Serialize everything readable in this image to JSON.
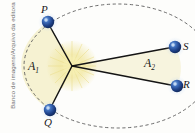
{
  "figure": {
    "credit": "Banco de imagens/Arquivo da editora",
    "background_color": "#fdfdfb",
    "orbit": {
      "style": "dashed-ellipse",
      "stroke_color": "#5a5a5a",
      "center_x": 118,
      "center_y": 66,
      "radius_x": 94,
      "radius_y": 62
    },
    "focus": {
      "name": "sun-focus",
      "x": 72,
      "y": 66,
      "glow_color": "#efe49a",
      "core_color": "#f7f0b8"
    },
    "sectors": [
      {
        "id": "A1",
        "label": "A",
        "subscript": "1",
        "fill_color": "#f6f2d2",
        "vertices": [
          "focus",
          "P",
          "Q"
        ]
      },
      {
        "id": "A2",
        "label": "A",
        "subscript": "2",
        "fill_color": "#f6f4dc",
        "vertices": [
          "focus",
          "S",
          "R"
        ]
      }
    ],
    "points": [
      {
        "id": "P",
        "label": "P",
        "x": 48,
        "y": 22,
        "color": "#1d3f85",
        "highlight_color": "#7fa8e0"
      },
      {
        "id": "Q",
        "label": "Q",
        "x": 50,
        "y": 110,
        "color": "#1d3f85",
        "highlight_color": "#7fa8e0"
      },
      {
        "id": "S",
        "label": "S",
        "x": 175,
        "y": 47,
        "color": "#1d3f85",
        "highlight_color": "#7fa8e0"
      },
      {
        "id": "R",
        "label": "R",
        "x": 177,
        "y": 86,
        "color": "#1d3f85",
        "highlight_color": "#7fa8e0"
      }
    ],
    "radii_lines": [
      {
        "from": "focus",
        "to": "P"
      },
      {
        "from": "focus",
        "to": "Q"
      },
      {
        "from": "focus",
        "to": "S"
      },
      {
        "from": "focus",
        "to": "R"
      }
    ],
    "line_color": "#141414"
  }
}
